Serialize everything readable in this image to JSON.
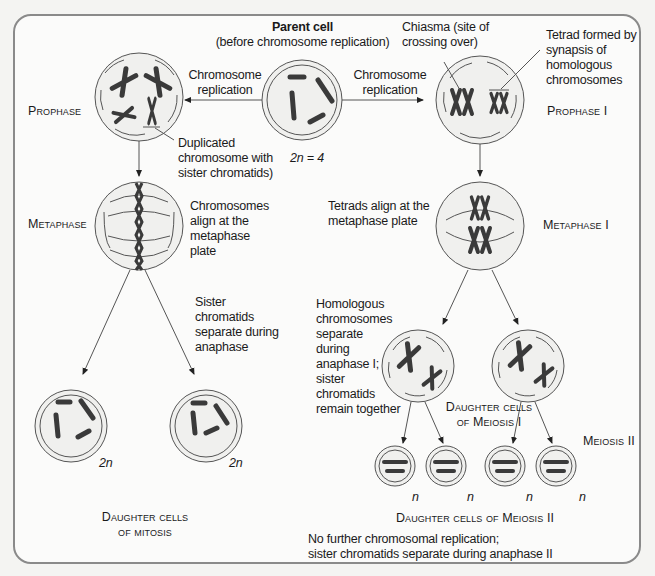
{
  "title": {
    "heading": "Parent cell",
    "subheading": "(before chromosome replication)"
  },
  "labels": {
    "chromosome_replication_left_1": "Chromosome",
    "chromosome_replication_left_2": "replication",
    "chromosome_replication_right_1": "Chromosome",
    "chromosome_replication_right_2": "replication",
    "chiasma_1": "Chiasma (site of",
    "chiasma_2": "crossing over)",
    "tetrad_1": "Tetrad formed by",
    "tetrad_2": "synapsis of",
    "tetrad_3": "homologous",
    "tetrad_4": "chromosomes",
    "duplicated_1": "Duplicated",
    "duplicated_2": "chromosome with",
    "duplicated_3": "sister  chromatids)",
    "ploidy_parent": "2n = 4",
    "chromosomes_align_1": "Chromosomes",
    "chromosomes_align_2": "align at the",
    "chromosomes_align_3": "metaphase",
    "chromosomes_align_4": "plate",
    "tetrads_align_1": "Tetrads align at the",
    "tetrads_align_2": "metaphase plate",
    "sister_sep_1": "Sister",
    "sister_sep_2": "chromatids",
    "sister_sep_3": "separate during",
    "sister_sep_4": "anaphase",
    "homologous_1": "Homologous",
    "homologous_2": "chromosomes",
    "homologous_3": "separate",
    "homologous_4": "during",
    "homologous_5": "anaphase I;",
    "homologous_6": "sister",
    "homologous_7": "chromatids",
    "homologous_8": "remain together",
    "ploidy_mitosis_1": "2n",
    "ploidy_mitosis_2": "2n",
    "ploidy_meiosis": [
      "n",
      "n",
      "n",
      "n"
    ],
    "footer_1": "No further chromosomal replication;",
    "footer_2": "sister chromatids separate during anaphase II"
  },
  "phases": {
    "prophase": "Prophase",
    "metaphase": "Metaphase",
    "prophase_i": "Prophase I",
    "metaphase_i": "Metaphase I",
    "meiosis_ii": "Meiosis II",
    "daughter_mitosis_1": "Daughter cells",
    "daughter_mitosis_2": "of mitosis",
    "daughter_meiosis_i_1": "Daughter cells",
    "daughter_meiosis_i_2": "of Meiosis I",
    "daughter_meiosis_ii": "Daughter cells of Meiosis II"
  },
  "colors": {
    "frame": "#8a8a8a",
    "chromosome": "#3a3a3a",
    "line": "#555555",
    "cell_fill": "#efefed"
  }
}
